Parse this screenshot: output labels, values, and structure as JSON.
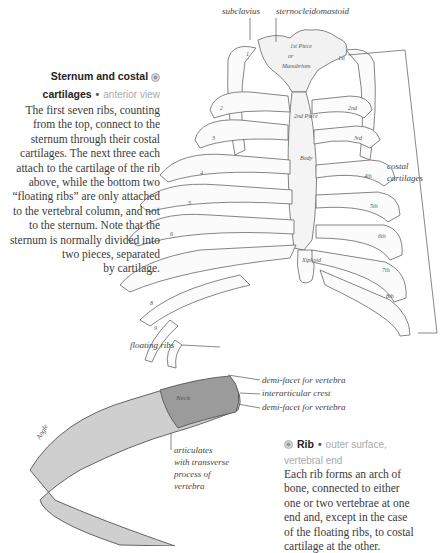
{
  "sternum_section": {
    "heading_line1": "Sternum and costal",
    "heading_line2": "cartilages",
    "bullet": "•",
    "subtitle": "anterior view",
    "icon": "circle-bullet-icon",
    "body_lines": [
      "The first seven ribs, counting",
      "from the top, connect to the",
      "sternum through their costal",
      "cartilages. The next three each",
      "attach to the cartilage of the rib",
      "above, while the bottom two",
      "“floating ribs” are only attached",
      "to the vertebral column, and not",
      "to the sternum. Note that the",
      "sternum is normally divided into",
      "two pieces, separated",
      "by cartilage."
    ]
  },
  "sternum_labels": {
    "subclavius": "subclavius",
    "sternocleidomastoid": "sternocleidomastoid",
    "costal_line1": "costal",
    "costal_line2": "cartilages",
    "floating_ribs": "floating ribs"
  },
  "rib_labels": {
    "demi_facet_top": "demi-facet for vertebra",
    "interarticular": "interarticular crest",
    "demi_facet_bottom": "demi-facet for vertebra",
    "articulates_lines": [
      "articulates",
      "with transverse",
      "process of",
      "vertebra"
    ]
  },
  "rib_section": {
    "icon": "circle-bullet-icon",
    "heading": "Rib",
    "bullet": "•",
    "subtitle_line1": "outer surface,",
    "subtitle_line2": "vertebral end",
    "body_lines": [
      "Each rib forms an arch of",
      "bone, connected to either",
      "one or two vertebrae at one",
      "end and, except in the case",
      "of the floating ribs, to costal",
      "cartilage at the other."
    ]
  }
}
